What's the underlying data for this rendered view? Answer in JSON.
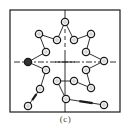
{
  "figure": {
    "caption": "(c)",
    "colors": {
      "line": "#1a1a1a",
      "node_fill": "#ffffff",
      "node_filled": "#333333",
      "background": "#ffffff"
    },
    "frame": {
      "x": 10,
      "y": 10,
      "width": 110,
      "height": 102
    },
    "center": {
      "x": 65,
      "y": 62
    },
    "nodes": [
      {
        "id": 1,
        "x": 65,
        "y": 22,
        "filled": false
      },
      {
        "id": 2,
        "x": 74,
        "y": 40,
        "filled": false
      },
      {
        "id": 3,
        "x": 91,
        "y": 34,
        "filled": false
      },
      {
        "id": 4,
        "x": 86,
        "y": 52,
        "filled": false
      },
      {
        "id": 5,
        "x": 104,
        "y": 61,
        "filled": false
      },
      {
        "id": 6,
        "x": 86,
        "y": 70,
        "filled": false
      },
      {
        "id": 7,
        "x": 91,
        "y": 88,
        "filled": false
      },
      {
        "id": 8,
        "x": 74,
        "y": 81,
        "filled": false
      },
      {
        "id": 9,
        "x": 57,
        "y": 81,
        "filled": false
      },
      {
        "id": 10,
        "x": 66,
        "y": 99,
        "filled": false
      },
      {
        "id": 11,
        "x": 104,
        "y": 105,
        "filled": false
      },
      {
        "id": 12,
        "x": 57,
        "y": 40,
        "filled": false
      },
      {
        "id": 13,
        "x": 39,
        "y": 34,
        "filled": false
      },
      {
        "id": 14,
        "x": 46,
        "y": 52,
        "filled": false
      },
      {
        "id": 15,
        "x": 28,
        "y": 62,
        "filled": true
      },
      {
        "id": 16,
        "x": 46,
        "y": 70,
        "filled": false
      },
      {
        "id": 17,
        "x": 40,
        "y": 89,
        "filled": false
      },
      {
        "id": 18,
        "x": 28,
        "y": 106,
        "filled": false
      }
    ],
    "path": [
      18,
      17,
      16,
      15,
      14,
      13,
      12,
      1,
      2,
      3,
      4,
      5,
      6,
      7,
      8,
      9,
      10,
      11
    ],
    "arrows": [
      {
        "from": 18,
        "to": 17
      },
      {
        "from": 10,
        "to": 11
      }
    ]
  }
}
